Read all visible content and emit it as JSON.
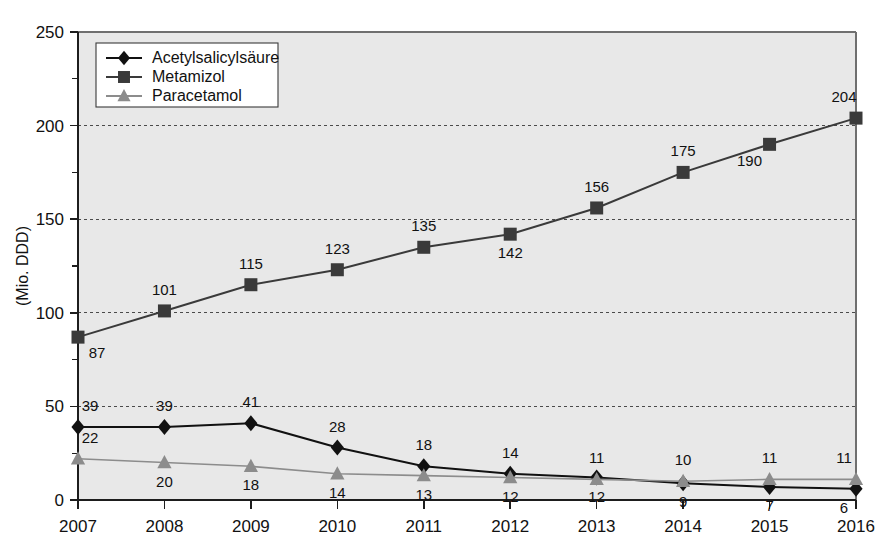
{
  "chart_data": {
    "type": "line",
    "title": "",
    "xlabel": "",
    "ylabel": "(Mio. DDD)",
    "categories": [
      "2007",
      "2008",
      "2009",
      "2010",
      "2011",
      "2012",
      "2013",
      "2014",
      "2015",
      "2016"
    ],
    "x": [
      2007,
      2008,
      2009,
      2010,
      2011,
      2012,
      2013,
      2014,
      2015,
      2016
    ],
    "ylim": [
      0,
      250
    ],
    "yticks": [
      0,
      50,
      100,
      150,
      200,
      250
    ],
    "yticks_minor": [
      25,
      75,
      125,
      175,
      225
    ],
    "grid": "horizontal-dotted",
    "legend_position": "top-left",
    "series": [
      {
        "name": "Acetylsalicylsäure",
        "marker": "diamond",
        "color": "#111111",
        "values": [
          39,
          39,
          41,
          28,
          18,
          14,
          12,
          9,
          7,
          6
        ],
        "label_positions": [
          "above",
          "above",
          "above",
          "above",
          "above",
          "above",
          "below",
          "below",
          "below",
          "below"
        ]
      },
      {
        "name": "Metamizol",
        "marker": "square",
        "color": "#3a3a3a",
        "values": [
          87,
          101,
          115,
          123,
          135,
          142,
          156,
          175,
          190,
          204
        ],
        "label_positions": [
          "below-right",
          "above",
          "above",
          "above",
          "above",
          "below",
          "above",
          "above",
          "below-left",
          "above"
        ]
      },
      {
        "name": "Paracetamol",
        "marker": "triangle",
        "color": "#8c8c8c",
        "values": [
          22,
          20,
          18,
          14,
          13,
          12,
          11,
          10,
          11,
          11
        ],
        "label_positions": [
          "above",
          "below",
          "below",
          "below",
          "below",
          "below",
          "above",
          "above",
          "above",
          "above"
        ]
      }
    ]
  },
  "axis": {
    "y_tick_labels": [
      "0",
      "50",
      "100",
      "150",
      "200",
      "250"
    ],
    "x_tick_labels": [
      "2007",
      "2008",
      "2009",
      "2010",
      "2011",
      "2012",
      "2013",
      "2014",
      "2015",
      "2016"
    ],
    "y_axis_title": "(Mio. DDD)"
  },
  "legend": {
    "items": [
      {
        "label": "Acetylsalicylsäure",
        "marker": "diamond",
        "color": "#111111"
      },
      {
        "label": "Metamizol",
        "marker": "square",
        "color": "#3a3a3a"
      },
      {
        "label": "Paracetamol",
        "marker": "triangle",
        "color": "#8c8c8c"
      }
    ]
  },
  "colors": {
    "plot_background": "#e8e8e8",
    "page_background": "#ffffff",
    "axis": "#1d1d1d",
    "grid": "#4a4a4a"
  }
}
